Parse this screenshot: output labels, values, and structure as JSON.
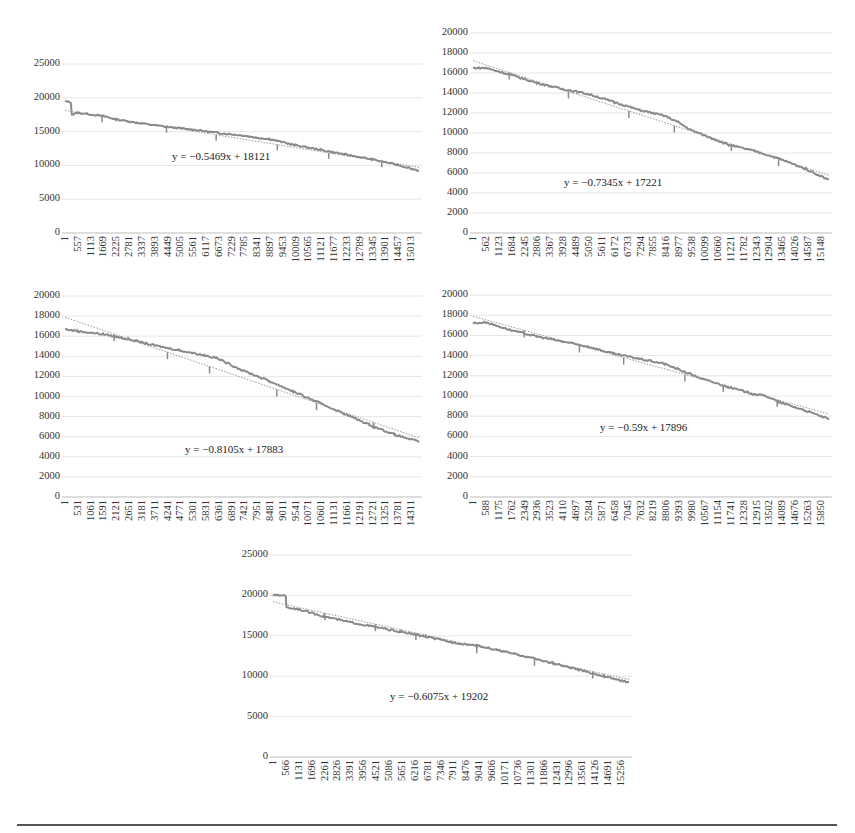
{
  "chart_data": [
    {
      "type": "line",
      "panel": "top-left",
      "title": "",
      "xlabel": "",
      "ylabel": "",
      "ylim": [
        0,
        25000
      ],
      "yticks": [
        0,
        5000,
        10000,
        15000,
        20000,
        25000
      ],
      "xticks": [
        "1",
        "557",
        "1113",
        "1669",
        "2225",
        "2781",
        "3337",
        "3893",
        "4449",
        "5005",
        "5561",
        "6117",
        "6673",
        "7229",
        "7785",
        "8341",
        "8897",
        "9453",
        "10009",
        "10565",
        "11121",
        "11677",
        "12233",
        "12789",
        "13345",
        "13901",
        "14457",
        "15013"
      ],
      "x_range": [
        1,
        15400
      ],
      "series": [
        {
          "name": "data",
          "style": "solid",
          "points": [
            [
              1,
              19500
            ],
            [
              250,
              19300
            ],
            [
              300,
              17500
            ],
            [
              557,
              17800
            ],
            [
              1669,
              17300
            ],
            [
              2225,
              16800
            ],
            [
              3337,
              16200
            ],
            [
              4449,
              15700
            ],
            [
              5561,
              15300
            ],
            [
              6673,
              14800
            ],
            [
              7785,
              14400
            ],
            [
              8341,
              14100
            ],
            [
              8897,
              13900
            ],
            [
              10009,
              13000
            ],
            [
              11121,
              12300
            ],
            [
              12233,
              11600
            ],
            [
              13345,
              10900
            ],
            [
              14457,
              10100
            ],
            [
              15400,
              9200
            ]
          ]
        },
        {
          "name": "linear trendline",
          "style": "dotted",
          "slope": -0.5469,
          "intercept": 18121
        }
      ],
      "equation": "y = −0.5469x + 18121",
      "grid": true,
      "legend": "none"
    },
    {
      "type": "line",
      "panel": "top-right",
      "title": "",
      "xlabel": "",
      "ylabel": "",
      "ylim": [
        0,
        20000
      ],
      "yticks": [
        0,
        2000,
        4000,
        6000,
        8000,
        10000,
        12000,
        14000,
        16000,
        18000,
        20000
      ],
      "xticks": [
        "1",
        "562",
        "1123",
        "1684",
        "2245",
        "2806",
        "3367",
        "3928",
        "4489",
        "5050",
        "5611",
        "6172",
        "6733",
        "7294",
        "7855",
        "8416",
        "8977",
        "9538",
        "10099",
        "10660",
        "11221",
        "11782",
        "12343",
        "12904",
        "13465",
        "14026",
        "14587",
        "15148"
      ],
      "x_range": [
        1,
        15600
      ],
      "series": [
        {
          "name": "data",
          "style": "solid",
          "points": [
            [
              1,
              16500
            ],
            [
              562,
              16500
            ],
            [
              1684,
              15800
            ],
            [
              2806,
              15000
            ],
            [
              3928,
              14400
            ],
            [
              5050,
              13900
            ],
            [
              6172,
              13100
            ],
            [
              7294,
              12300
            ],
            [
              8416,
              11700
            ],
            [
              8977,
              11100
            ],
            [
              9538,
              10300
            ],
            [
              10660,
              9300
            ],
            [
              11221,
              8800
            ],
            [
              12343,
              8200
            ],
            [
              13465,
              7400
            ],
            [
              14587,
              6400
            ],
            [
              15600,
              5300
            ]
          ]
        },
        {
          "name": "linear trendline",
          "style": "dotted",
          "slope": -0.7345,
          "intercept": 17221
        }
      ],
      "equation": "y = −0.7345x + 17221",
      "grid": true,
      "legend": "none"
    },
    {
      "type": "line",
      "panel": "middle-left",
      "title": "",
      "xlabel": "",
      "ylabel": "",
      "ylim": [
        0,
        20000
      ],
      "yticks": [
        0,
        2000,
        4000,
        6000,
        8000,
        10000,
        12000,
        14000,
        16000,
        18000,
        20000
      ],
      "xticks": [
        "1",
        "531",
        "1061",
        "1591",
        "2121",
        "2651",
        "3181",
        "3711",
        "4241",
        "4771",
        "5301",
        "5831",
        "6361",
        "6891",
        "7421",
        "7951",
        "8481",
        "9011",
        "9541",
        "10071",
        "10601",
        "11131",
        "11661",
        "12191",
        "12721",
        "13251",
        "13781",
        "14311"
      ],
      "x_range": [
        1,
        14800
      ],
      "series": [
        {
          "name": "data",
          "style": "solid",
          "points": [
            [
              1,
              16700
            ],
            [
              531,
              16500
            ],
            [
              1591,
              16200
            ],
            [
              2651,
              15700
            ],
            [
              3711,
              15100
            ],
            [
              4771,
              14600
            ],
            [
              5831,
              14100
            ],
            [
              6361,
              13800
            ],
            [
              7421,
              12600
            ],
            [
              8481,
              11600
            ],
            [
              9541,
              10500
            ],
            [
              10601,
              9400
            ],
            [
              11661,
              8300
            ],
            [
              12721,
              7200
            ],
            [
              13781,
              6200
            ],
            [
              14800,
              5500
            ]
          ]
        },
        {
          "name": "linear trendline",
          "style": "dotted",
          "slope": -0.8105,
          "intercept": 17883
        }
      ],
      "equation": "y = −0.8105x + 17883",
      "grid": true,
      "legend": "none"
    },
    {
      "type": "line",
      "panel": "middle-right",
      "title": "",
      "xlabel": "",
      "ylabel": "",
      "ylim": [
        0,
        20000
      ],
      "yticks": [
        0,
        2000,
        4000,
        6000,
        8000,
        10000,
        12000,
        14000,
        16000,
        18000,
        20000
      ],
      "xticks": [
        "1",
        "588",
        "1175",
        "1762",
        "2349",
        "2936",
        "3523",
        "4110",
        "4697",
        "5284",
        "5871",
        "6458",
        "7045",
        "7632",
        "8219",
        "8806",
        "9393",
        "9980",
        "10567",
        "11154",
        "11741",
        "12328",
        "12915",
        "13502",
        "14089",
        "14676",
        "15263",
        "15850"
      ],
      "x_range": [
        1,
        16400
      ],
      "series": [
        {
          "name": "data",
          "style": "solid",
          "points": [
            [
              1,
              17200
            ],
            [
              588,
              17300
            ],
            [
              1762,
              16500
            ],
            [
              2936,
              15900
            ],
            [
              4110,
              15400
            ],
            [
              5284,
              14900
            ],
            [
              6458,
              14200
            ],
            [
              7632,
              13700
            ],
            [
              8806,
              13200
            ],
            [
              9393,
              12700
            ],
            [
              10567,
              11700
            ],
            [
              11741,
              10900
            ],
            [
              12915,
              10200
            ],
            [
              13502,
              10000
            ],
            [
              14089,
              9400
            ],
            [
              15263,
              8600
            ],
            [
              16400,
              7700
            ]
          ]
        },
        {
          "name": "linear trendline",
          "style": "dotted",
          "slope": -0.59,
          "intercept": 17896
        }
      ],
      "equation": "y = −0.59x + 17896",
      "grid": true,
      "legend": "none"
    },
    {
      "type": "line",
      "panel": "bottom-center",
      "title": "",
      "xlabel": "",
      "ylabel": "",
      "ylim": [
        0,
        25000
      ],
      "yticks": [
        0,
        5000,
        10000,
        15000,
        20000,
        25000
      ],
      "xticks": [
        "1",
        "566",
        "1131",
        "1696",
        "2261",
        "2826",
        "3391",
        "3956",
        "4521",
        "5086",
        "5651",
        "6216",
        "6781",
        "7346",
        "7911",
        "8476",
        "9041",
        "9606",
        "10171",
        "10736",
        "11301",
        "11866",
        "12431",
        "12996",
        "13561",
        "14126",
        "14691",
        "15256"
      ],
      "x_range": [
        1,
        15800
      ],
      "series": [
        {
          "name": "data",
          "style": "solid",
          "points": [
            [
              1,
              20000
            ],
            [
              566,
              20000
            ],
            [
              600,
              18500
            ],
            [
              1131,
              18300
            ],
            [
              2261,
              17400
            ],
            [
              3391,
              16700
            ],
            [
              4521,
              16100
            ],
            [
              5651,
              15500
            ],
            [
              6781,
              14900
            ],
            [
              7911,
              14200
            ],
            [
              9041,
              13800
            ],
            [
              10171,
              13100
            ],
            [
              11301,
              12400
            ],
            [
              12431,
              11600
            ],
            [
              13561,
              10800
            ],
            [
              14691,
              10000
            ],
            [
              15800,
              9200
            ]
          ]
        },
        {
          "name": "linear trendline",
          "style": "dotted",
          "slope": -0.6075,
          "intercept": 19202
        }
      ],
      "equation": "y = −0.6075x + 19202",
      "grid": true,
      "legend": "none"
    }
  ],
  "layout": {
    "panels": [
      {
        "left": 62,
        "top": 33,
        "width": 360,
        "zeroY": 233,
        "maxY": 64,
        "eqX": 172,
        "eqY": 150,
        "ylabX": 20
      },
      {
        "left": 470,
        "top": 33,
        "width": 362,
        "zeroY": 233,
        "maxY": 33,
        "eqX": 564,
        "eqY": 176,
        "ylabX": 428
      },
      {
        "left": 62,
        "top": 295,
        "width": 360,
        "zeroY": 497,
        "maxY": 296,
        "eqX": 185,
        "eqY": 443,
        "ylabX": 20
      },
      {
        "left": 470,
        "top": 295,
        "width": 362,
        "zeroY": 497,
        "maxY": 295,
        "eqX": 600,
        "eqY": 421,
        "ylabX": 428
      },
      {
        "left": 270,
        "top": 555,
        "width": 362,
        "zeroY": 757,
        "maxY": 555,
        "eqX": 390,
        "eqY": 690,
        "ylabX": 228
      }
    ]
  },
  "colors": {
    "data_line": "#8a8a8a",
    "trendline": "#9a9a9a",
    "grid": "#e6e6e6",
    "axis": "#bbbbbb",
    "rule": "#555555"
  }
}
